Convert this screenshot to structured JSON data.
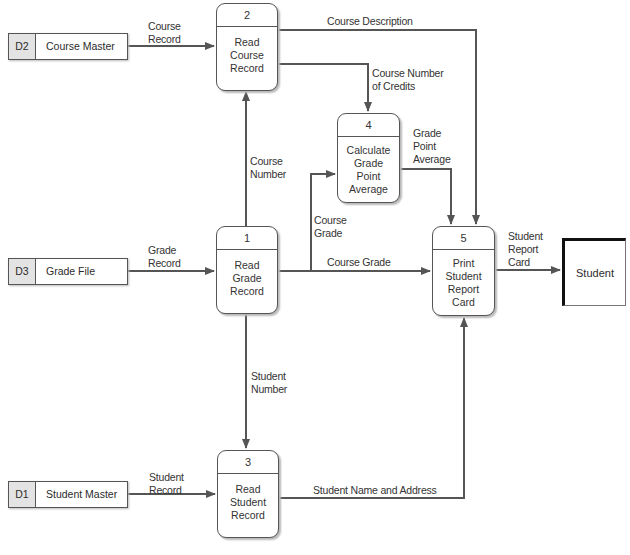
{
  "diagram": {
    "type": "data-flow-diagram",
    "processes": [
      {
        "id": "1",
        "name_lines": [
          "Read",
          "Grade",
          "Record"
        ]
      },
      {
        "id": "2",
        "name_lines": [
          "Read",
          "Course",
          "Record"
        ]
      },
      {
        "id": "3",
        "name_lines": [
          "Read",
          "Student",
          "Record"
        ]
      },
      {
        "id": "4",
        "name_lines": [
          "Calculate",
          "Grade",
          "Point",
          "Average"
        ]
      },
      {
        "id": "5",
        "name_lines": [
          "Print",
          "Student",
          "Report",
          "Card"
        ]
      }
    ],
    "data_stores": [
      {
        "id": "D2",
        "name": "Course Master"
      },
      {
        "id": "D3",
        "name": "Grade File"
      },
      {
        "id": "D1",
        "name": "Student Master"
      }
    ],
    "external_entities": [
      {
        "name": "Student"
      }
    ],
    "flows": [
      {
        "from": "D2",
        "to": "2",
        "label_lines": [
          "Course",
          "Record"
        ]
      },
      {
        "from": "D3",
        "to": "1",
        "label_lines": [
          "Grade",
          "Record"
        ]
      },
      {
        "from": "D1",
        "to": "3",
        "label_lines": [
          "Student",
          "Record"
        ]
      },
      {
        "from": "1",
        "to": "2",
        "label_lines": [
          "Course",
          "Number"
        ]
      },
      {
        "from": "1",
        "to": "3",
        "label_lines": [
          "Student",
          "Number"
        ]
      },
      {
        "from": "1",
        "to": "4",
        "label_lines": [
          "Course",
          "Grade"
        ]
      },
      {
        "from": "1",
        "to": "5",
        "label_lines": [
          "Course Grade"
        ]
      },
      {
        "from": "2",
        "to": "5",
        "label_lines": [
          "Course Description"
        ]
      },
      {
        "from": "2",
        "to": "4",
        "label_lines": [
          "Course Number",
          "of Credits"
        ]
      },
      {
        "from": "4",
        "to": "5",
        "label_lines": [
          "Grade",
          "Point",
          "Average"
        ]
      },
      {
        "from": "3",
        "to": "5",
        "label_lines": [
          "Student Name and Address"
        ]
      },
      {
        "from": "5",
        "to": "Student",
        "label_lines": [
          "Student",
          "Report",
          "Card"
        ]
      }
    ]
  },
  "colors": {
    "line": "#555555",
    "store_id_fill": "#e3e3e3",
    "entity_border": "#111111"
  }
}
